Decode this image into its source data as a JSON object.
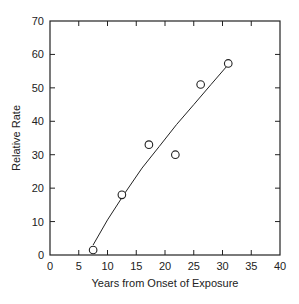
{
  "chart_data": {
    "type": "scatter",
    "title": "",
    "xlabel": "Years from Onset of Exposure",
    "ylabel": "Relative Rate",
    "xlim": [
      0,
      40
    ],
    "ylim": [
      0,
      70
    ],
    "x_ticks": [
      0,
      5,
      10,
      15,
      20,
      25,
      30,
      35,
      40
    ],
    "y_ticks": [
      0,
      10,
      20,
      30,
      40,
      50,
      60,
      70
    ],
    "grid": false,
    "legend": null,
    "series": [
      {
        "name": "Observed",
        "marker": "open-circle",
        "points": [
          {
            "x": 7.5,
            "y": 1.5
          },
          {
            "x": 12.5,
            "y": 18
          },
          {
            "x": 17.2,
            "y": 33
          },
          {
            "x": 21.8,
            "y": 30
          },
          {
            "x": 26.2,
            "y": 51
          },
          {
            "x": 31.0,
            "y": 57.3
          }
        ]
      },
      {
        "name": "Fitted curve",
        "marker": "line",
        "points": [
          {
            "x": 7.5,
            "y": 3
          },
          {
            "x": 10,
            "y": 10.5
          },
          {
            "x": 13,
            "y": 18.5
          },
          {
            "x": 16,
            "y": 26
          },
          {
            "x": 19,
            "y": 32.5
          },
          {
            "x": 22,
            "y": 39
          },
          {
            "x": 25,
            "y": 45
          },
          {
            "x": 28,
            "y": 51
          },
          {
            "x": 31,
            "y": 57
          }
        ]
      }
    ]
  }
}
